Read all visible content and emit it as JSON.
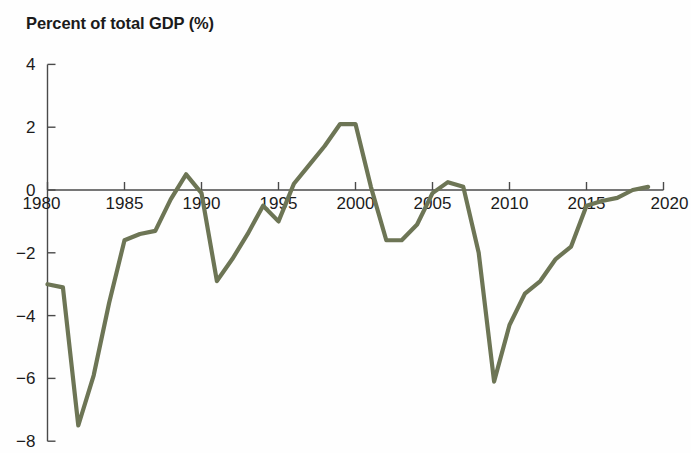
{
  "chart_data": {
    "type": "line",
    "title": "Percent of total GDP (%)",
    "xlabel": "",
    "ylabel": "",
    "xlim": [
      1980,
      2020
    ],
    "ylim": [
      -8,
      4
    ],
    "yticks": [
      4,
      2,
      0,
      -2,
      -4,
      -6,
      -8
    ],
    "ytick_labels": [
      "4",
      "2",
      "0",
      "−2",
      "−4",
      "−6",
      "−8"
    ],
    "xticks": [
      1980,
      1985,
      1990,
      1995,
      2000,
      2005,
      2010,
      2015,
      2020
    ],
    "xtick_labels": [
      "1980",
      "1985",
      "1990",
      "1995",
      "2000",
      "2005",
      "2010",
      "2015",
      "2020"
    ],
    "grid": false,
    "legend": null,
    "line_color": "#6d7555",
    "x": [
      1980,
      1981,
      1982,
      1983,
      1984,
      1985,
      1986,
      1987,
      1988,
      1989,
      1990,
      1991,
      1992,
      1993,
      1994,
      1995,
      1996,
      1997,
      1998,
      1999,
      2000,
      2001,
      2002,
      2003,
      2004,
      2005,
      2006,
      2007,
      2008,
      2009,
      2010,
      2011,
      2012,
      2013,
      2014,
      2015,
      2016,
      2017,
      2018,
      2019
    ],
    "values": [
      -3.0,
      -3.1,
      -7.5,
      -5.9,
      -3.6,
      -1.6,
      -1.4,
      -1.3,
      -0.3,
      0.5,
      -0.1,
      -2.9,
      -2.2,
      -1.4,
      -0.5,
      -1.0,
      0.2,
      0.8,
      1.4,
      2.1,
      2.1,
      0.1,
      -1.6,
      -1.6,
      -1.1,
      -0.1,
      0.25,
      0.1,
      -2.0,
      -6.1,
      -4.3,
      -3.3,
      -2.9,
      -2.2,
      -1.8,
      -0.5,
      -0.35,
      -0.25,
      0.0,
      0.1
    ],
    "series_name": "Percent of total GDP"
  },
  "figure": {
    "background_color": "#ffffff",
    "title_color": "#1b1b1b",
    "axis_color": "#4a4a4a"
  }
}
